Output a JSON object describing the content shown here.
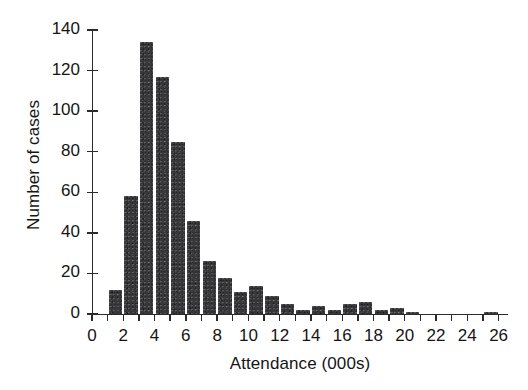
{
  "chart_data": {
    "type": "bar",
    "title": "",
    "subtitle": "",
    "xlabel": "Attendance (000s)",
    "ylabel": "Number of cases",
    "xlim": [
      0,
      26.6
    ],
    "ylim": [
      0,
      140
    ],
    "grid": false,
    "legend": null,
    "bar_color": "#38383a",
    "axis_color": "#2b2b2b",
    "background": "#ffffff",
    "bin_width": 1,
    "x_tick_step": 1,
    "x_label_step": 2,
    "y_tick_step": 20,
    "xticklabels": [
      "0",
      "2",
      "4",
      "6",
      "8",
      "10",
      "12",
      "14",
      "16",
      "18",
      "20",
      "22",
      "24",
      "26"
    ],
    "xticklabel_values": [
      0,
      2,
      4,
      6,
      8,
      10,
      12,
      14,
      16,
      18,
      20,
      22,
      24,
      26
    ],
    "yticklabels": [
      "0",
      "20",
      "40",
      "60",
      "80",
      "100",
      "120",
      "140"
    ],
    "yticklabel_values": [
      0,
      20,
      40,
      60,
      80,
      100,
      120,
      140
    ],
    "categories": [
      "1-2",
      "2-3",
      "3-4",
      "4-5",
      "5-6",
      "6-7",
      "7-8",
      "8-9",
      "9-10",
      "10-11",
      "11-12",
      "12-13",
      "13-14",
      "14-15",
      "15-16",
      "16-17",
      "17-18",
      "18-19",
      "19-20",
      "20-21",
      "21-22",
      "22-23",
      "23-24",
      "24-25",
      "25-26"
    ],
    "bin_starts": [
      1,
      2,
      3,
      4,
      5,
      6,
      7,
      8,
      9,
      10,
      11,
      12,
      13,
      14,
      15,
      16,
      17,
      18,
      19,
      20,
      21,
      22,
      23,
      24,
      25
    ],
    "values": [
      12,
      58,
      134,
      117,
      85,
      46,
      26,
      18,
      11,
      14,
      9,
      5,
      2,
      4,
      2,
      5,
      6,
      2,
      3,
      1,
      0,
      0,
      0,
      0,
      1
    ]
  }
}
